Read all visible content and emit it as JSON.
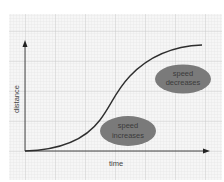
{
  "diagram": {
    "axes": {
      "x_label": "time",
      "y_label": "distance"
    },
    "curve": {
      "shape": "s-curve",
      "description": "distance increases slowly, then rapidly, then levels off"
    },
    "annotations": [
      {
        "id": "speed-increases",
        "line1": "speed",
        "line2": "increases",
        "fill": "#7a7a7a"
      },
      {
        "id": "speed-decreases",
        "line1": "speed",
        "line2": "decreases",
        "fill": "#7a7a7a"
      }
    ],
    "colors": {
      "background": "#ffffff",
      "grid_paper": "#f4f4f4",
      "grid_minor": "#dddddd",
      "grid_major": "#c4c4c4",
      "axis": "#333333",
      "curve": "#2e2e2e",
      "ellipse": "#7a7a7a",
      "label_text": "#444444"
    }
  }
}
